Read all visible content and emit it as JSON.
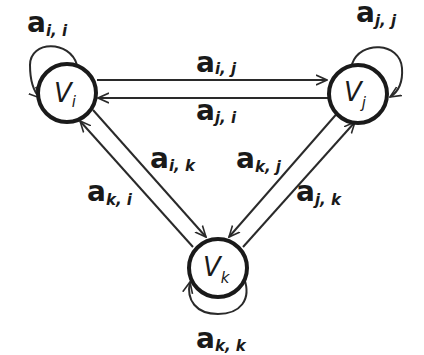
{
  "diagram": {
    "type": "directed-graph",
    "nodes": [
      {
        "id": "i",
        "label": "V",
        "sub": "i"
      },
      {
        "id": "j",
        "label": "V",
        "sub": "j"
      },
      {
        "id": "k",
        "label": "V",
        "sub": "k"
      }
    ],
    "edges": [
      {
        "from": "i",
        "to": "i",
        "label": "a",
        "sub": "i, i"
      },
      {
        "from": "j",
        "to": "j",
        "label": "a",
        "sub": "j, j"
      },
      {
        "from": "k",
        "to": "k",
        "label": "a",
        "sub": "k, k"
      },
      {
        "from": "i",
        "to": "j",
        "label": "a",
        "sub": "i, j"
      },
      {
        "from": "j",
        "to": "i",
        "label": "a",
        "sub": "j, i"
      },
      {
        "from": "i",
        "to": "k",
        "label": "a",
        "sub": "i, k"
      },
      {
        "from": "k",
        "to": "i",
        "label": "a",
        "sub": "k, i"
      },
      {
        "from": "k",
        "to": "j",
        "label": "a",
        "sub": "k, j"
      },
      {
        "from": "j",
        "to": "k",
        "label": "a",
        "sub": "j, k"
      }
    ]
  }
}
